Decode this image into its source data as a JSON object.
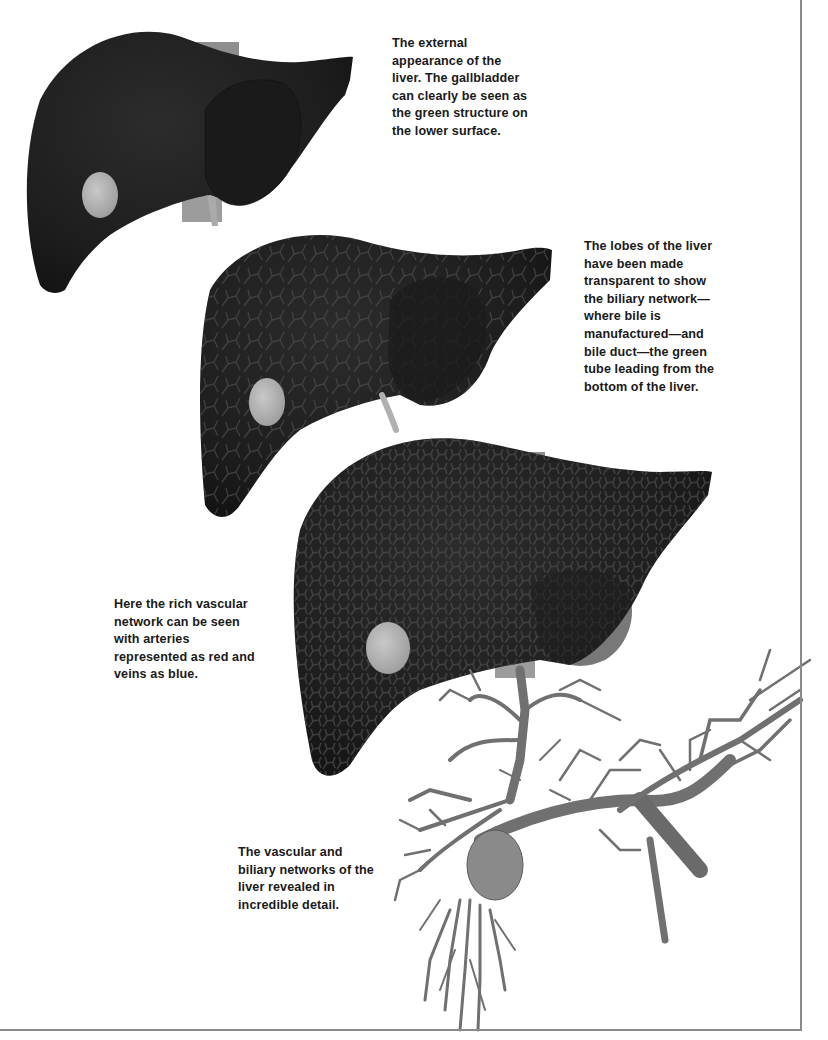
{
  "page": {
    "background": "#ffffff",
    "frame_color": "#8a8a8a"
  },
  "figures": [
    {
      "id": "liver-external",
      "description": "external appearance of the liver with gallbladder"
    },
    {
      "id": "liver-transparent-biliary",
      "description": "transparent liver lobes showing biliary network and bile duct"
    },
    {
      "id": "liver-vascular",
      "description": "liver showing rich vascular network"
    },
    {
      "id": "vascular-biliary-tree",
      "description": "vascular and biliary networks of the liver revealed"
    }
  ],
  "captions": {
    "external": {
      "lines": [
        "The external",
        "appearance of the",
        "liver. The gallbladder",
        "can clearly be seen as",
        "the green structure on",
        "the lower surface."
      ]
    },
    "lobes": {
      "lines": [
        "The lobes of the liver",
        "have been made",
        "transparent to show",
        "the biliary network—",
        "where bile is",
        "manufactured—and",
        "bile duct—the green",
        "tube leading from the",
        "bottom of the liver."
      ]
    },
    "vascular": {
      "lines": [
        "Here the rich vascular",
        "network can be seen",
        "with arteries",
        "represented as red and",
        "veins as blue."
      ]
    },
    "networks": {
      "lines": [
        "The vascular and",
        "biliary networks of the",
        "liver revealed in",
        "incredible detail."
      ]
    }
  },
  "colors": {
    "liver_dark": "#1c1c1c",
    "liver_mid": "#2a2a2a",
    "gallbladder": "#b8b8b8",
    "vessel": "#7a7a7a",
    "vessel_dark": "#555555",
    "caption_text": "#1a1a1a"
  }
}
